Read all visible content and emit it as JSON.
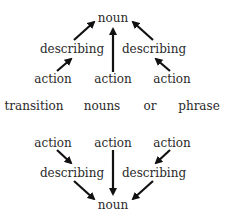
{
  "top_tree": {
    "root": "noun",
    "describing_left": "describing",
    "describing_right": "describing",
    "action_left": "action",
    "action_middle": "action",
    "action_right": "action"
  },
  "middle_row": {
    "words": [
      "transition",
      "nouns",
      "or",
      "phrase"
    ]
  },
  "bottom_tree": {
    "action_left": "action",
    "action_middle": "action",
    "action_right": "action",
    "describing_left": "describing",
    "describing_right": "describing",
    "root": "noun"
  },
  "colors": {
    "text": "#2a2a2a",
    "arrow": "#111111",
    "background": "#ffffff"
  }
}
